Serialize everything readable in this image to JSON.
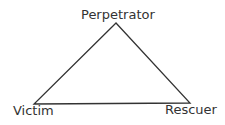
{
  "diagram": {
    "nodes": [
      {
        "id": "perpetrator",
        "label": "Perpetrator",
        "position": "top"
      },
      {
        "id": "victim",
        "label": "Victim",
        "position": "bottom-left"
      },
      {
        "id": "rescuer",
        "label": "Rescuer",
        "position": "bottom-right"
      }
    ],
    "edges": [
      {
        "from": "perpetrator",
        "to": "victim"
      },
      {
        "from": "victim",
        "to": "rescuer"
      },
      {
        "from": "rescuer",
        "to": "perpetrator"
      }
    ],
    "line_color": "#333333",
    "text_color": "#333333"
  }
}
